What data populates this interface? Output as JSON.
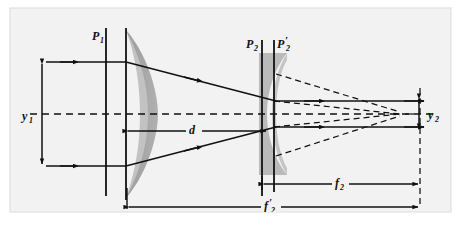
{
  "figure": {
    "type": "optical-ray-diagram",
    "canvas": {
      "width": 461,
      "height": 228
    },
    "colors": {
      "background": "#f2f2f2",
      "plate": "#ffffff",
      "lens_fill": "#a8a8a8",
      "lens_fill_2": "#b4b4b4",
      "line": "#111111",
      "axis": "#111111",
      "border": "#d8d8d8"
    }
  },
  "labels": {
    "p1": {
      "base": "P",
      "sub": "1",
      "prime": "",
      "x": 94,
      "y": 37
    },
    "p2": {
      "base": "P",
      "sub": "2",
      "prime": "",
      "x": 249,
      "y": 46
    },
    "p2p": {
      "base": "P",
      "sub": "2",
      "prime": "′",
      "x": 274,
      "y": 46
    },
    "y1": {
      "base": "y",
      "sub": "1",
      "prime": "",
      "x": 28,
      "y": 120
    },
    "y2": {
      "base": "y",
      "sub": "2",
      "prime": "",
      "x": 432,
      "y": 120
    },
    "d": {
      "base": "d",
      "sub": "",
      "prime": "",
      "x": 193,
      "y": 133
    },
    "f2": {
      "base": "f",
      "sub": "2",
      "prime": "",
      "x": 339,
      "y": 186
    },
    "f2p": {
      "base": "f",
      "sub": "2",
      "prime": "′",
      "x": 268,
      "y": 211
    }
  },
  "geometry": {
    "axis_y": 114,
    "ray_top_y": 62,
    "ray_bot_y": 166,
    "plane_p1_x": 106,
    "plane_v1_x": 126,
    "plane_p2_x": 262,
    "plane_p2p_x": 274,
    "focal_point_x": 400,
    "image_plane_x": 420,
    "dim_d_from": 126,
    "dim_d_to": 268,
    "dim_f2_from": 262,
    "dim_f2_to": 420,
    "dim_f2p_from": 127,
    "dim_f2p_to": 420,
    "dim_d_y": 131,
    "dim_f2_y": 184,
    "dim_f2p_y": 207,
    "y1_arrow_x": 42,
    "y2_arrow_x": 419,
    "lens1_center_x": 130,
    "lens2_center_x": 268
  },
  "elements": {
    "incoming_ray_top": "parallel ray entering at top",
    "incoming_ray_bottom": "parallel ray entering at bottom",
    "outgoing_ray_top": "parallel ray exiting at top",
    "outgoing_ray_bottom": "parallel ray exiting at bottom",
    "optical_axis": "dashed horizontal optical axis",
    "virtual_rays": "dashed back-projected rays converging at focal point"
  }
}
